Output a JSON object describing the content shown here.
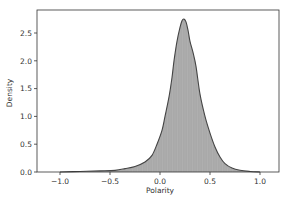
{
  "chart_data": {
    "type": "area",
    "title": "",
    "xlabel": "Polarity",
    "ylabel": "Density",
    "xlim": [
      -1.2,
      1.2
    ],
    "ylim": [
      0,
      2.85
    ],
    "xticks": [
      -1.0,
      -0.5,
      0.0,
      0.5,
      1.0
    ],
    "xtick_labels": [
      "−1.0",
      "−0.5",
      "0.0",
      "0.5",
      "1.0"
    ],
    "yticks": [
      0.0,
      0.5,
      1.0,
      1.5,
      2.0,
      2.5
    ],
    "ytick_labels": [
      "0.0",
      "0.5",
      "1.0",
      "1.5",
      "2.0",
      "2.5"
    ],
    "grid": false,
    "legend": null,
    "series": [
      {
        "name": "Polarity density (histogram + KDE)",
        "x": [
          -1.0,
          -0.8,
          -0.6,
          -0.45,
          -0.35,
          -0.25,
          -0.15,
          -0.08,
          -0.03,
          0.02,
          0.05,
          0.09,
          0.12,
          0.14,
          0.17,
          0.2,
          0.22,
          0.24,
          0.26,
          0.28,
          0.3,
          0.33,
          0.36,
          0.4,
          0.45,
          0.5,
          0.55,
          0.6,
          0.65,
          0.72,
          0.8,
          0.9,
          1.0
        ],
        "values": [
          0.0,
          0.01,
          0.02,
          0.03,
          0.06,
          0.1,
          0.18,
          0.3,
          0.5,
          0.75,
          1.0,
          1.35,
          1.7,
          2.0,
          2.35,
          2.6,
          2.72,
          2.75,
          2.7,
          2.55,
          2.35,
          2.15,
          1.9,
          1.4,
          1.0,
          0.7,
          0.45,
          0.27,
          0.15,
          0.07,
          0.03,
          0.01,
          0.0
        ]
      }
    ],
    "fill_color": "#a9a9a9",
    "line_color": "#444444"
  },
  "labels": {
    "xlabel": "Polarity",
    "ylabel": "Density",
    "xticks": [
      "−1.0",
      "−0.5",
      "0.0",
      "0.5",
      "1.0"
    ],
    "yticks": [
      "0.0",
      "0.5",
      "1.0",
      "1.5",
      "2.0",
      "2.5"
    ]
  }
}
